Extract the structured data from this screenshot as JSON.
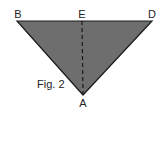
{
  "figure": {
    "caption": "Fig. 2",
    "fill_color": "#6e6e6e",
    "edge_color": "#1a1a1a",
    "labels": {
      "B": "B",
      "E": "E",
      "D": "D",
      "A": "A"
    },
    "segments": [
      "BD",
      "DA",
      "AB",
      "EA (dashed)"
    ]
  }
}
